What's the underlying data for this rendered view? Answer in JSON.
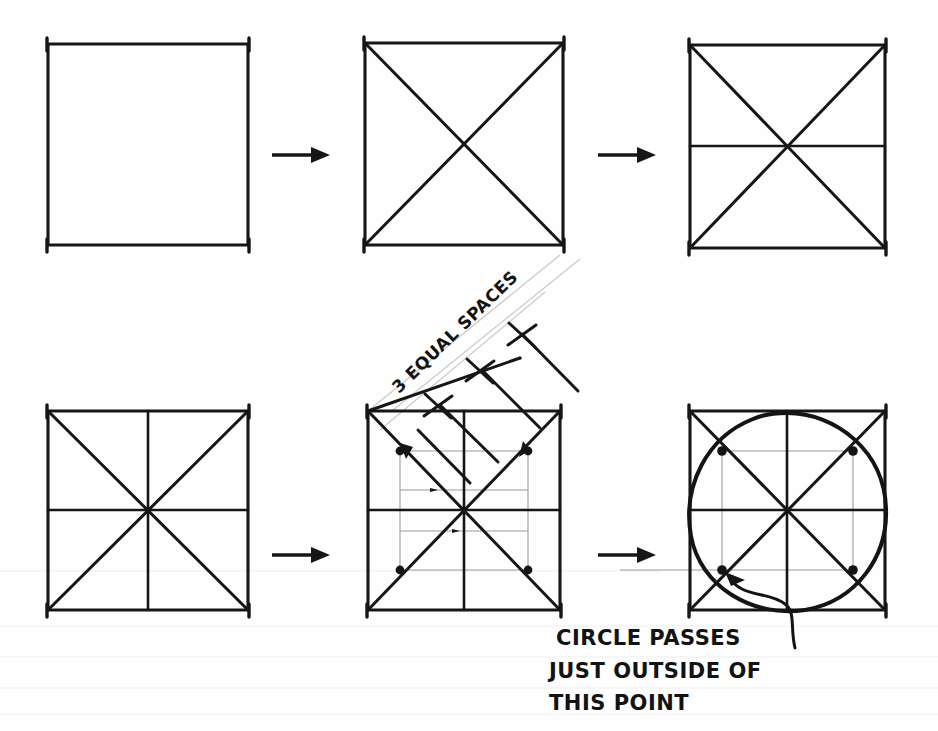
{
  "document": {
    "title": "Circle In Square Construction Steps",
    "medium": "hand-drawn pencil sketch on white paper",
    "background_color": "#ffffff",
    "ink_color": "#161616",
    "guide_color": "#9a9a9a"
  },
  "annotations": {
    "three_equal_spaces": "3 EQUAL SPACES",
    "circle_note_line1": "CIRCLE PASSES",
    "circle_note_line2": "JUST OUTSIDE OF",
    "circle_note_line3": "THIS POINT"
  },
  "steps": [
    {
      "index": 1,
      "name": "plain-square",
      "caption": "",
      "features": [
        "square outline"
      ],
      "box": {
        "x": 48,
        "y": 44,
        "w": 200,
        "h": 201
      }
    },
    {
      "index": 2,
      "name": "square-with-diagonals",
      "caption": "",
      "features": [
        "square outline",
        "both diagonals"
      ],
      "box": {
        "x": 365,
        "y": 43,
        "w": 198,
        "h": 202
      }
    },
    {
      "index": 3,
      "name": "square-with-diagonals-and-horizontal",
      "caption": "",
      "features": [
        "square outline",
        "both diagonals",
        "horizontal midline"
      ],
      "box": {
        "x": 690,
        "y": 45,
        "w": 195,
        "h": 203
      }
    },
    {
      "index": 4,
      "name": "square-with-full-grid",
      "caption": "",
      "features": [
        "square outline",
        "both diagonals",
        "horizontal midline",
        "vertical midline"
      ],
      "box": {
        "x": 48,
        "y": 411,
        "w": 200,
        "h": 199
      }
    },
    {
      "index": 5,
      "name": "square-with-thirds-construction",
      "caption": "3 EQUAL SPACES",
      "features": [
        "square outline",
        "both diagonals",
        "midlines",
        "diagonal measuring line with 3 tick marks",
        "projector lines",
        "four construction dots on diagonals"
      ],
      "box": {
        "x": 368,
        "y": 411,
        "w": 192,
        "h": 199
      }
    },
    {
      "index": 6,
      "name": "square-with-inscribed-circle",
      "caption": "CIRCLE PASSES JUST OUTSIDE OF THIS POINT",
      "features": [
        "square outline",
        "both diagonals",
        "midlines",
        "four construction dots",
        "hand drawn circle",
        "leader arrow to lower-left dot"
      ],
      "box": {
        "x": 690,
        "y": 411,
        "w": 195,
        "h": 199
      }
    }
  ],
  "arrows": [
    {
      "name": "arrow-step1-to-step2",
      "from_step": 1,
      "to_step": 2,
      "x1": 272,
      "y1": 155,
      "x2": 327,
      "y2": 155
    },
    {
      "name": "arrow-step2-to-step3",
      "from_step": 2,
      "to_step": 3,
      "x1": 598,
      "y1": 155,
      "x2": 653,
      "y2": 155
    },
    {
      "name": "arrow-step4-to-step5",
      "from_step": 4,
      "to_step": 5,
      "x1": 272,
      "y1": 555,
      "x2": 327,
      "y2": 555
    },
    {
      "name": "arrow-step5-to-step6",
      "from_step": 5,
      "to_step": 6,
      "x1": 598,
      "y1": 555,
      "x2": 653,
      "y2": 555
    }
  ],
  "tick_marks": {
    "name": "three-equal-spaces-ticks",
    "count": 3,
    "description": "cross ticks dividing the diagonal measuring line into 3 equal spaces"
  },
  "construction_dots": {
    "count_per_square": 4,
    "placement": "at one-third points along each diagonal from the centre",
    "radius": 4.4
  }
}
